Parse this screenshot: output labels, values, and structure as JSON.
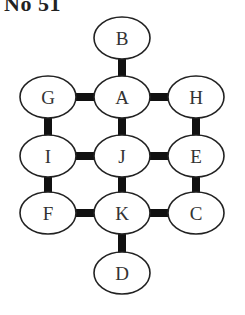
{
  "title": "No 51",
  "colors": {
    "edge": "#111111",
    "node_stroke": "#222222",
    "node_fill": "#ffffff",
    "label": "#333333"
  },
  "nodes": [
    {
      "id": "B",
      "label": "B",
      "cx": 122,
      "cy": 38
    },
    {
      "id": "G",
      "label": "G",
      "cx": 48,
      "cy": 97
    },
    {
      "id": "A",
      "label": "A",
      "cx": 122,
      "cy": 97
    },
    {
      "id": "H",
      "label": "H",
      "cx": 196,
      "cy": 97
    },
    {
      "id": "I",
      "label": "I",
      "cx": 48,
      "cy": 156
    },
    {
      "id": "J",
      "label": "J",
      "cx": 122,
      "cy": 156
    },
    {
      "id": "E",
      "label": "E",
      "cx": 196,
      "cy": 156
    },
    {
      "id": "F",
      "label": "F",
      "cx": 48,
      "cy": 213
    },
    {
      "id": "K",
      "label": "K",
      "cx": 122,
      "cy": 213
    },
    {
      "id": "C",
      "label": "C",
      "cx": 196,
      "cy": 213
    },
    {
      "id": "D",
      "label": "D",
      "cx": 122,
      "cy": 273
    }
  ],
  "edges": [
    [
      "B",
      "A"
    ],
    [
      "G",
      "A"
    ],
    [
      "A",
      "H"
    ],
    [
      "G",
      "I"
    ],
    [
      "A",
      "J"
    ],
    [
      "H",
      "E"
    ],
    [
      "I",
      "J"
    ],
    [
      "J",
      "E"
    ],
    [
      "I",
      "F"
    ],
    [
      "J",
      "K"
    ],
    [
      "E",
      "C"
    ],
    [
      "F",
      "K"
    ],
    [
      "K",
      "C"
    ],
    [
      "K",
      "D"
    ]
  ]
}
